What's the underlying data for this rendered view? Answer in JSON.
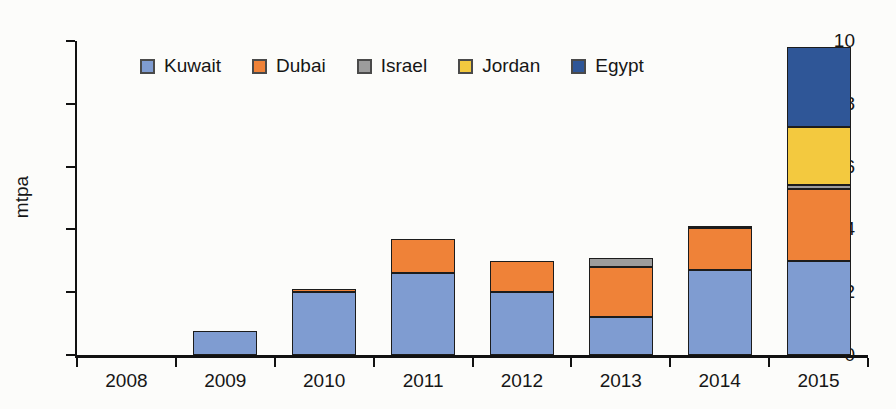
{
  "chart_data": {
    "type": "bar",
    "stacked": true,
    "title": "",
    "xlabel": "",
    "ylabel": "mtpa",
    "ylim": [
      0,
      10
    ],
    "yticks": [
      0,
      2,
      4,
      6,
      8,
      10
    ],
    "grid": false,
    "legend_position": "top",
    "categories": [
      "2008",
      "2009",
      "2010",
      "2011",
      "2012",
      "2013",
      "2014",
      "2015"
    ],
    "series": [
      {
        "name": "Kuwait",
        "color": "#7f9cd1",
        "values": [
          0,
          0.75,
          2.0,
          2.6,
          2.0,
          1.2,
          2.7,
          3.0
        ]
      },
      {
        "name": "Dubai",
        "color": "#ef8238",
        "values": [
          0,
          0,
          0.1,
          1.1,
          1.0,
          1.6,
          1.35,
          2.3
        ]
      },
      {
        "name": "Israel",
        "color": "#9c9c9c",
        "values": [
          0,
          0,
          0,
          0,
          0,
          0.3,
          0.05,
          0.1
        ]
      },
      {
        "name": "Jordan",
        "color": "#f3c93f",
        "values": [
          0,
          0,
          0,
          0,
          0,
          0,
          0,
          1.85
        ]
      },
      {
        "name": "Egypt",
        "color": "#2f5697",
        "values": [
          0,
          0,
          0,
          0,
          0,
          0,
          0,
          2.55
        ]
      }
    ],
    "axis_color": "#111111",
    "background_color": "#fcfcfa",
    "bar_width_px": 64
  }
}
